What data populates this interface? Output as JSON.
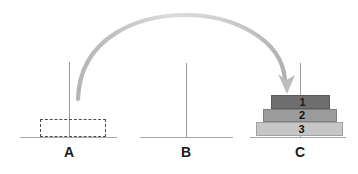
{
  "diagram": {
    "background_color": "#ffffff"
  },
  "pegs": [
    {
      "id": "A",
      "label": "A",
      "x": 69,
      "base_left": 20,
      "base_width": 97,
      "rod_top": 62,
      "rod_bottom": 137,
      "label_x": 61,
      "label_y": 144,
      "disks": []
    },
    {
      "id": "B",
      "label": "B",
      "x": 186,
      "base_left": 140,
      "base_width": 93,
      "rod_top": 63,
      "rod_bottom": 137,
      "label_x": 178,
      "label_y": 144,
      "disks": []
    },
    {
      "id": "C",
      "label": "C",
      "x": 300,
      "base_left": 250,
      "base_width": 96,
      "rod_top": 63,
      "rod_bottom": 137,
      "label_x": 292,
      "label_y": 144,
      "disks": [
        1,
        2,
        3
      ]
    }
  ],
  "disks": [
    {
      "number": "1",
      "size_rank": 1,
      "color": "#6e6e6e",
      "left": 271,
      "top": 95,
      "width": 59,
      "height": 14,
      "peg": "C"
    },
    {
      "number": "2",
      "size_rank": 2,
      "color": "#9b9b9b",
      "left": 263,
      "top": 109,
      "width": 74,
      "height": 13,
      "peg": "C"
    },
    {
      "number": "3",
      "size_rank": 3,
      "color": "#c6c6c6",
      "left": 256,
      "top": 122,
      "width": 87,
      "height": 14,
      "peg": "C"
    }
  ],
  "ghost_disk": {
    "label": "dashed-outline-disk-at-peg-a",
    "left": 40,
    "top": 119,
    "width": 66,
    "height": 18,
    "border_color": "#4d4d4d",
    "border_style": "dashed"
  },
  "move_arrow": {
    "label": "move-arrow-a-to-c",
    "from_peg": "A",
    "to_peg": "C",
    "color_start": "#b8b8b8",
    "color_mid": "#d4d4d4",
    "color_end": "#b0b0b0",
    "stroke_width": 4,
    "start_x": 78,
    "start_y": 99,
    "end_x": 288,
    "end_y": 92,
    "apex_y": 16
  },
  "colors": {
    "rod": "#9a9a9a",
    "base": "#a8a8a8",
    "label_text": "#1a1a1a",
    "disk_1": "#6e6e6e",
    "disk_2": "#9b9b9b",
    "disk_3": "#c6c6c6"
  }
}
